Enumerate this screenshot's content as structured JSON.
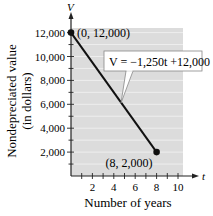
{
  "chart_data": {
    "type": "line",
    "title": "",
    "xlabel": "Number of years",
    "ylabel": "Nondepreciated value (in dollars)",
    "ylabel_lines": [
      "Nondepreciated value",
      "(in dollars)"
    ],
    "x_axis_var": "t",
    "y_axis_var": "V",
    "xlim": [
      0,
      10
    ],
    "ylim": [
      0,
      12000
    ],
    "x_ticks": [
      2,
      4,
      6,
      8,
      10
    ],
    "x_minor_step": 1,
    "y_ticks": [
      2000,
      4000,
      6000,
      8000,
      10000,
      12000
    ],
    "y_tick_labels": [
      "2,000",
      "4,000",
      "6,000",
      "8,000",
      "10,000",
      "12,000"
    ],
    "y_minor_step": 1000,
    "grid": true,
    "legend": null,
    "series": [
      {
        "name": "V = -1,250t + 12,000",
        "x": [
          0,
          8
        ],
        "y": [
          12000,
          2000
        ],
        "color": "#111111"
      }
    ],
    "points": [
      {
        "x": 0,
        "y": 12000,
        "label": "(0, 12,000)"
      },
      {
        "x": 8,
        "y": 2000,
        "label": "(8, 2,000)"
      }
    ],
    "annotations": [
      {
        "text": "V = −1,250t +12,000",
        "type": "callout",
        "points_to": {
          "x": 5.5,
          "y": 5125
        }
      }
    ]
  },
  "colors": {
    "plot_bg": "#dcdcdc",
    "grid": "#f2f2f2",
    "line": "#111111",
    "axis": "#222222"
  }
}
